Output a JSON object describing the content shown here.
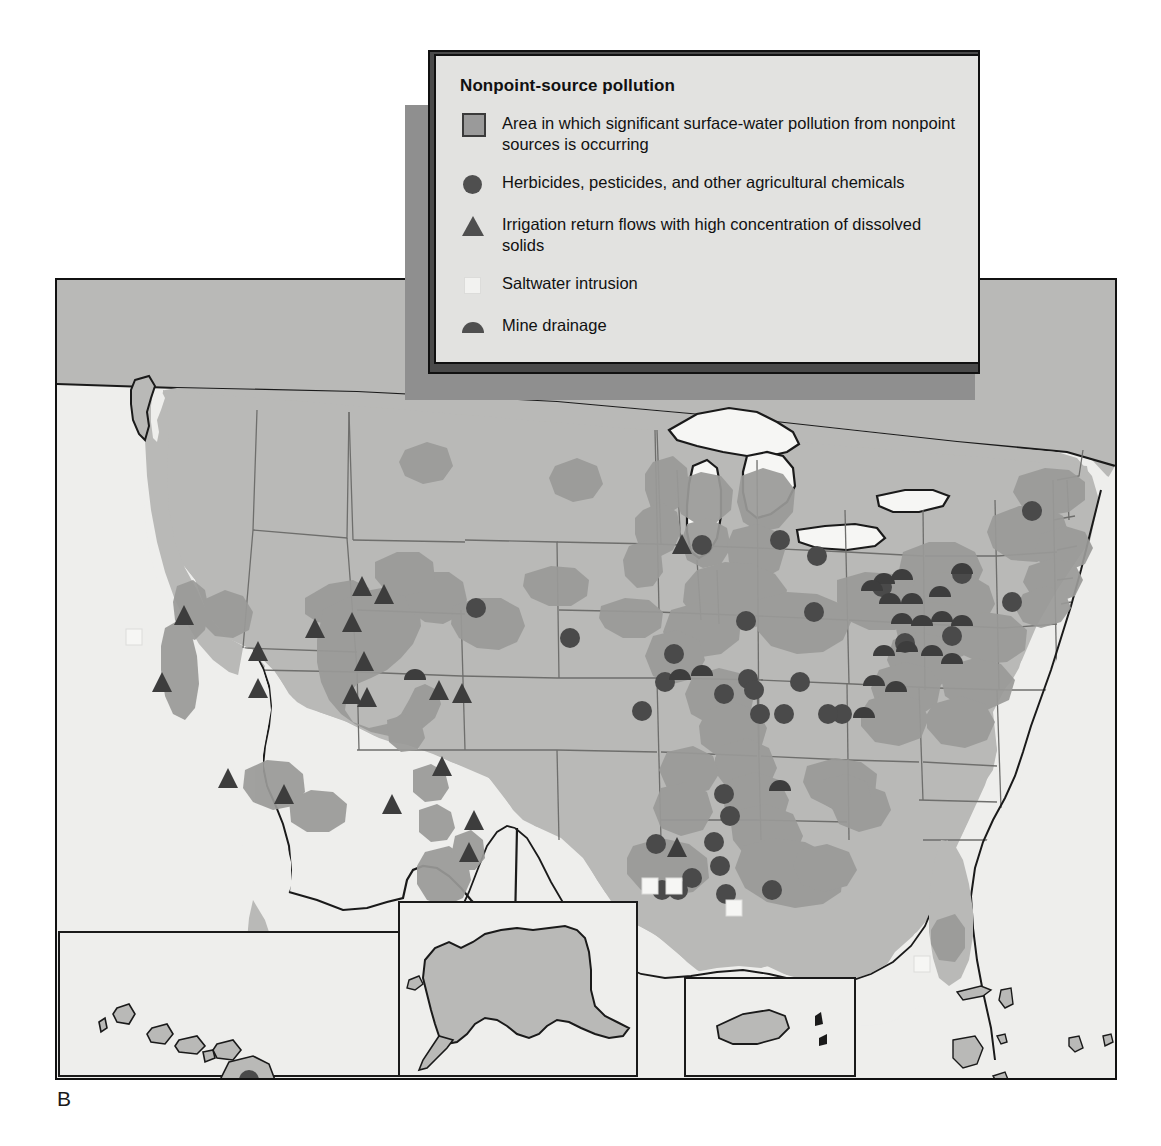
{
  "figure": {
    "panel_label": "B"
  },
  "legend": {
    "title": "Nonpoint-source pollution",
    "items": [
      {
        "symbol": "area-swatch",
        "label": "Area in which significant surface-water pollution from nonpoint sources is occurring"
      },
      {
        "symbol": "circle-marker",
        "label": "Herbicides, pesticides, and other agricultural chemicals"
      },
      {
        "symbol": "triangle-marker",
        "label": "Irrigation return flows with high concentration of dissolved solids"
      },
      {
        "symbol": "white-square-marker",
        "label": "Saltwater intrusion"
      },
      {
        "symbol": "half-circle-marker",
        "label": "Mine drainage"
      }
    ]
  },
  "map": {
    "title": "United States nonpoint-source water pollution",
    "colors": {
      "ocean": "#eeeeec",
      "land": "#b9b9b7",
      "polluted_area": "#9a9a98",
      "lakes": "#f4f4f2",
      "border": "#1a1a1a",
      "state_line": "#6e6e6c",
      "marker_dark": "#4a4a4a",
      "marker_white": "#f5f5f3"
    },
    "insets": [
      {
        "name": "hawaii",
        "label": ""
      },
      {
        "name": "alaska",
        "label": ""
      },
      {
        "name": "puerto-rico",
        "label": ""
      }
    ],
    "markers": {
      "circle": [
        [
          474,
          604
        ],
        [
          568,
          634
        ],
        [
          744,
          617
        ],
        [
          746,
          675
        ],
        [
          812,
          608
        ],
        [
          815,
          552
        ],
        [
          778,
          536
        ],
        [
          700,
          541
        ],
        [
          640,
          707
        ],
        [
          663,
          678
        ],
        [
          672,
          650
        ],
        [
          722,
          690
        ],
        [
          752,
          686
        ],
        [
          758,
          710
        ],
        [
          782,
          710
        ],
        [
          798,
          678
        ],
        [
          840,
          710
        ],
        [
          826,
          710
        ],
        [
          880,
          583
        ],
        [
          903,
          639
        ],
        [
          950,
          632
        ],
        [
          1030,
          507
        ],
        [
          960,
          570
        ],
        [
          1010,
          598
        ],
        [
          722,
          790
        ],
        [
          728,
          812
        ],
        [
          712,
          838
        ],
        [
          718,
          862
        ],
        [
          690,
          874
        ],
        [
          654,
          840
        ],
        [
          660,
          886
        ],
        [
          676,
          886
        ],
        [
          724,
          890
        ],
        [
          770,
          886
        ],
        [
          202,
          1023
        ]
      ],
      "triangle": [
        [
          150,
          688
        ],
        [
          172,
          621
        ],
        [
          246,
          694
        ],
        [
          272,
          800
        ],
        [
          216,
          784
        ],
        [
          246,
          657
        ],
        [
          303,
          634
        ],
        [
          340,
          628
        ],
        [
          340,
          700
        ],
        [
          355,
          703
        ],
        [
          352,
          667
        ],
        [
          372,
          600
        ],
        [
          350,
          592
        ],
        [
          380,
          810
        ],
        [
          430,
          772
        ],
        [
          427,
          696
        ],
        [
          450,
          699
        ],
        [
          457,
          858
        ],
        [
          462,
          826
        ],
        [
          670,
          550
        ],
        [
          665,
          853
        ]
      ],
      "half_circle": [
        [
          412,
          686
        ],
        [
          778,
          797
        ],
        [
          882,
          580
        ],
        [
          900,
          576
        ],
        [
          870,
          587
        ],
        [
          888,
          600
        ],
        [
          910,
          600
        ],
        [
          938,
          593
        ],
        [
          960,
          570
        ],
        [
          900,
          620
        ],
        [
          920,
          622
        ],
        [
          940,
          618
        ],
        [
          960,
          622
        ],
        [
          905,
          648
        ],
        [
          930,
          652
        ],
        [
          950,
          660
        ],
        [
          882,
          652
        ],
        [
          678,
          676
        ],
        [
          700,
          672
        ]
      ],
      "white_square": [
        [
          130,
          635
        ],
        [
          648,
          884
        ],
        [
          672,
          884
        ],
        [
          732,
          906
        ],
        [
          920,
          962
        ]
      ]
    }
  }
}
